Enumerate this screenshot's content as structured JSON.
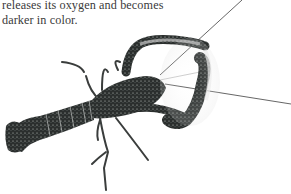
{
  "page": {
    "text_lines": [
      "releases its oxygen and becomes",
      "darker in color."
    ]
  },
  "figure": {
    "alt": "Lobster (crayfish) photograph, dark speckled shell with long antennae",
    "colors": {
      "shell": "#2b2f2e",
      "speckle": "#cfd4d0",
      "antenna": "#4a4a4a",
      "background": "#ffffff",
      "text": "#3a3a3a"
    }
  }
}
